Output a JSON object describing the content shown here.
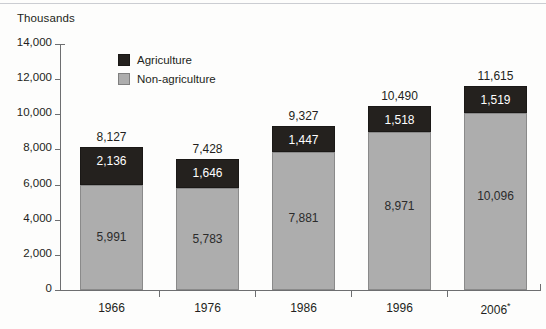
{
  "chart_data": {
    "type": "bar",
    "subtype": "stacked-vertical",
    "title": "",
    "unit_label": "Thousands",
    "xlabel": "",
    "ylabel": "",
    "ylim": [
      0,
      14000
    ],
    "ytick_values": [
      0,
      2000,
      4000,
      6000,
      8000,
      10000,
      12000,
      14000
    ],
    "ytick_labels": [
      "0",
      "2,000",
      "4,000",
      "6,000",
      "8,000",
      "10,000",
      "12,000",
      "14,000"
    ],
    "grid": false,
    "legend_position": "inside-top-left",
    "categories": [
      "1966",
      "1976",
      "1986",
      "1996",
      "2006*"
    ],
    "series": [
      {
        "name": "Non-agriculture",
        "color": "#adadad",
        "values": [
          5991,
          5783,
          7881,
          8971,
          10096
        ],
        "value_labels": [
          "5,991",
          "5,783",
          "7,881",
          "8,971",
          "10,096"
        ]
      },
      {
        "name": "Agriculture",
        "color": "#24211e",
        "values": [
          2136,
          1646,
          1447,
          1518,
          1519
        ],
        "value_labels": [
          "2,136",
          "1,646",
          "1,447",
          "1,518",
          "1,519"
        ]
      }
    ],
    "totals": [
      8127,
      7428,
      9327,
      10490,
      11615
    ],
    "total_labels": [
      "8,127",
      "7,428",
      "9,327",
      "10,490",
      "11,615"
    ]
  },
  "legend": {
    "items": [
      {
        "label": "Agriculture",
        "swatch": "dark"
      },
      {
        "label": "Non-agriculture",
        "swatch": "gray"
      }
    ]
  },
  "colors": {
    "agriculture": "#24211e",
    "non_agriculture": "#adadad",
    "axis": "#6d6e70",
    "text": "#231f20",
    "background": "#fdfdfc"
  }
}
